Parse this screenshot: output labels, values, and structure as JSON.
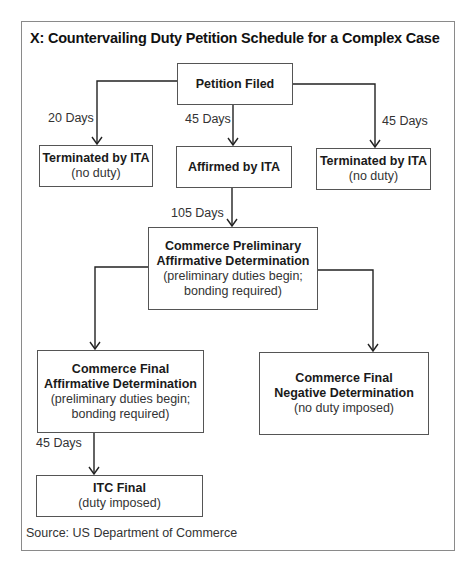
{
  "diagram": {
    "title": "X: Countervailing Duty Petition Schedule for a Complex Case",
    "source": "Source: US Department of Commerce",
    "nodes": {
      "petition": {
        "title": "Petition Filed"
      },
      "terminated_left": {
        "title": "Terminated by ITA",
        "note": "(no duty)"
      },
      "affirmed": {
        "title": "Affirmed by ITA"
      },
      "terminated_right": {
        "title": "Terminated by ITA",
        "note": "(no duty)"
      },
      "prelim": {
        "title_line1": "Commerce Preliminary",
        "title_line2": "Affirmative Determination",
        "note_line1": "(preliminary duties begin;",
        "note_line2": "bonding required)"
      },
      "final_affirm": {
        "title_line1": "Commerce Final",
        "title_line2": "Affirmative Determination",
        "note_line1": "(preliminary duties begin;",
        "note_line2": "bonding required)"
      },
      "final_negative": {
        "title_line1": "Commerce Final",
        "title_line2": "Negative Determination",
        "note": "(no duty imposed)"
      },
      "itc_final": {
        "title": "ITC Final",
        "note": "(duty imposed)"
      }
    },
    "edges": {
      "to_terminated_left": "20 Days",
      "to_affirmed": "45 Days",
      "to_terminated_right": "45 Days",
      "to_prelim": "105 Days",
      "to_itc_final": "45 Days"
    }
  }
}
